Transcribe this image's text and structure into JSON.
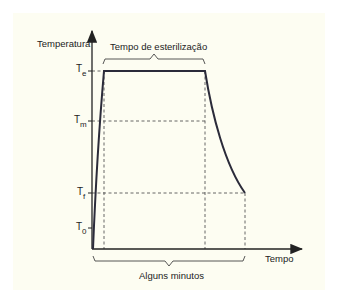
{
  "diagram": {
    "y_axis_label": "Temperatura",
    "x_axis_label": "Tempo",
    "top_brace_label": "Tempo de esterilização",
    "bottom_brace_label": "Alguns minutos",
    "levels": [
      {
        "id": "Te",
        "base": "T",
        "sub": "e"
      },
      {
        "id": "Tm",
        "base": "T",
        "sub": "m"
      },
      {
        "id": "Tf",
        "base": "T",
        "sub": "f"
      },
      {
        "id": "T0",
        "base": "T",
        "sub": "0"
      }
    ],
    "colors": {
      "background": "#fdfdf2",
      "curve": "#2b2b3a",
      "axis": "#222222",
      "dashed": "#555555"
    }
  }
}
